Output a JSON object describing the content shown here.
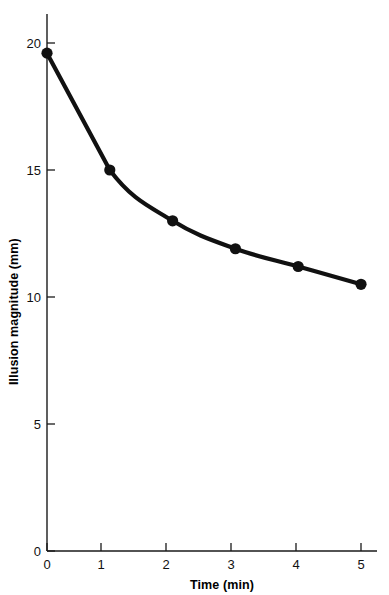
{
  "chart_data": {
    "type": "line",
    "title": "",
    "xlabel": "Time (min)",
    "ylabel": "Illusion magnitude (mm)",
    "x": [
      0,
      1,
      2,
      3,
      4,
      5
    ],
    "values": [
      19.6,
      15.0,
      13.0,
      11.9,
      11.2,
      10.5
    ],
    "series": [
      {
        "name": "Illusion magnitude",
        "values": [
          19.6,
          15.0,
          13.0,
          11.9,
          11.2,
          10.5
        ]
      }
    ],
    "xlim": [
      0,
      5
    ],
    "ylim": [
      0,
      21
    ],
    "xticks": [
      0,
      1,
      2,
      3,
      4,
      5
    ],
    "yticks": [
      0,
      5,
      10,
      15,
      20
    ],
    "xtick_labels": [
      "0",
      "1",
      "2",
      "3",
      "4",
      "5"
    ],
    "ytick_labels": [
      "0",
      "5",
      "10",
      "15",
      "20"
    ],
    "grid": false,
    "legend": false,
    "legend_position": "none",
    "marker": "filled-circle",
    "line_color": "#111111",
    "marker_color": "#111111",
    "background_color": "#ffffff"
  },
  "axes": {
    "x_title": "Time (min)",
    "y_title": "Illusion magnitude (mm)"
  }
}
